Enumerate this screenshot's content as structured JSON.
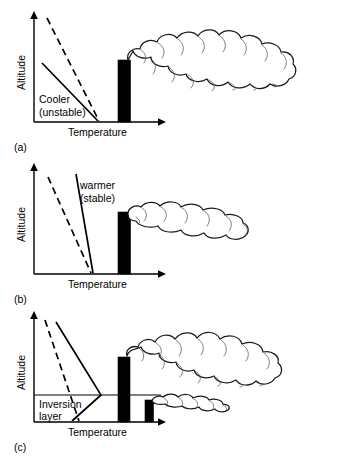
{
  "figure": {
    "type": "scientific-diagram",
    "background_color": "#ffffff",
    "line_color": "#000000",
    "stack_color": "#000000",
    "cloud_fill": "#ffffff"
  },
  "common": {
    "y_axis_label": "Altitude",
    "x_axis_label": "Temperature",
    "dashed_line_meaning": "dry adiabatic lapse rate reference",
    "solid_line_meaning": "environmental temperature profile"
  },
  "panels": [
    {
      "id": "a",
      "label": "(a)",
      "y_axis_label": "Altitude",
      "x_axis_label": "Temperature",
      "annotation_line1": "Cooler",
      "annotation_line2": "(unstable)",
      "stability": "unstable",
      "plume_type": "looping",
      "stack_count": 1,
      "has_inversion": false,
      "inversion_label_line1": "",
      "inversion_label_line2": ""
    },
    {
      "id": "b",
      "label": "(b)",
      "y_axis_label": "Altitude",
      "x_axis_label": "Temperature",
      "annotation_line1": "warmer",
      "annotation_line2": "(stable)",
      "stability": "stable",
      "plume_type": "fanning",
      "stack_count": 1,
      "has_inversion": false,
      "inversion_label_line1": "",
      "inversion_label_line2": ""
    },
    {
      "id": "c",
      "label": "(c)",
      "y_axis_label": "Altitude",
      "x_axis_label": "Temperature",
      "annotation_line1": "",
      "annotation_line2": "",
      "stability": "inversion",
      "plume_type": "lofting-and-trapped",
      "stack_count": 2,
      "has_inversion": true,
      "inversion_label_line1": "Inversion",
      "inversion_label_line2": "layer"
    }
  ]
}
